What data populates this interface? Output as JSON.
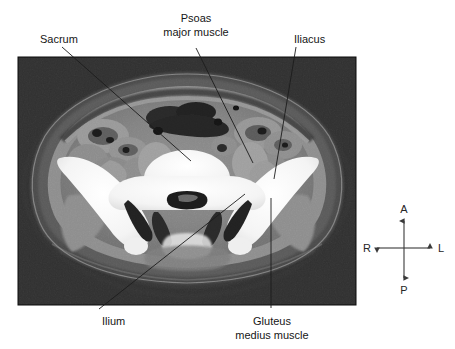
{
  "figure": {
    "kind": "ct-scan-annotated-figure",
    "modality": "CT",
    "plane": "axial",
    "region": "pelvis",
    "background_color": "#ffffff",
    "scan_frame": {
      "x": 18,
      "y": 57,
      "width": 338,
      "height": 248,
      "border_color": "#0a0a0a",
      "background_color": "#121212"
    }
  },
  "labels": [
    {
      "id": "sacrum",
      "text": "Sacrum",
      "text_x": 40,
      "text_y": 43,
      "anchor": "start",
      "leader": {
        "x1": 62,
        "y1": 47,
        "x2": 191,
        "y2": 161
      }
    },
    {
      "id": "psoas-major-muscle",
      "line1": "Psoas",
      "line2": "major muscle",
      "text_x": 196,
      "text_y": 30,
      "anchor": "middle",
      "leader": {
        "x1": 196,
        "y1": 48,
        "x2": 253,
        "y2": 163
      }
    },
    {
      "id": "iliacus",
      "text": "Iliacus",
      "text_x": 294,
      "text_y": 43,
      "anchor": "start",
      "leader": {
        "x1": 296,
        "y1": 47,
        "x2": 274,
        "y2": 179
      }
    },
    {
      "id": "ilium",
      "text": "Ilium",
      "text_x": 102,
      "text_y": 325,
      "anchor": "start",
      "leader": {
        "x1": 99,
        "y1": 309,
        "x2": 245,
        "y2": 194
      }
    },
    {
      "id": "gluteus-medius-muscle",
      "line1": "Gluteus",
      "line2": "medius muscle",
      "text_x": 272,
      "text_y": 325,
      "anchor": "middle",
      "leader": {
        "x1": 271,
        "y1": 308,
        "x2": 271,
        "y2": 198
      }
    }
  ],
  "orientation_compass": {
    "center_x": 404,
    "center_y": 248,
    "arm": 28,
    "directions": [
      {
        "id": "anterior",
        "abbr": "A",
        "position": "top",
        "x": 404,
        "y": 211
      },
      {
        "id": "posterior",
        "abbr": "P",
        "position": "bottom",
        "x": 404,
        "y": 292
      },
      {
        "id": "right",
        "abbr": "R",
        "position": "left",
        "x": 367,
        "y": 252
      },
      {
        "id": "left",
        "abbr": "L",
        "position": "right",
        "x": 441,
        "y": 252
      }
    ]
  },
  "colors": {
    "text": "#161616",
    "leader_line": "#1c1c1c",
    "compass": "#3a3a3a",
    "scan_dark": "#121212",
    "bone": "#f2f2f2",
    "muscle": "#8b8b8b",
    "fat": "#5a5a5a",
    "bowel_gas": "#1d1d1d"
  }
}
